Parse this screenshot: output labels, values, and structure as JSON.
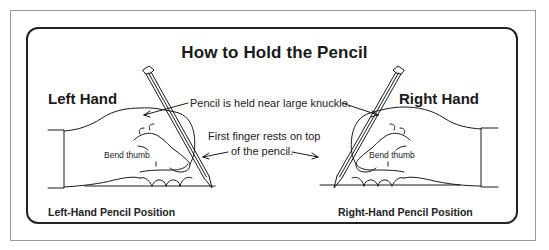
{
  "title": "How to Hold the Pencil",
  "left": {
    "heading": "Left Hand",
    "thumb_label": "Bend thumb",
    "caption": "Left-Hand Pencil Position"
  },
  "right": {
    "heading": "Right Hand",
    "thumb_label": "Bend thumb",
    "caption": "Right-Hand Pencil Position"
  },
  "annotations": {
    "knuckle": "Pencil is held near large knuckle.",
    "finger_line1": "First finger rests on top",
    "finger_line2": "of the pencil."
  },
  "colors": {
    "ink": "#1a1a1a",
    "frame": "#9a9a9a",
    "background": "#ffffff"
  }
}
